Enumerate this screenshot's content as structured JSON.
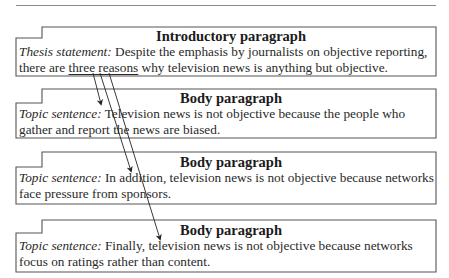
{
  "diagram": {
    "type": "essay-structure",
    "colors": {
      "border": "#555555",
      "text": "#222222",
      "arrow": "#222222",
      "rule": "#8a8a8a"
    },
    "boxes": [
      {
        "heading": "Introductory paragraph",
        "label": "Thesis statement:",
        "text_before": " Despite the emphasis by journalists on objective reporting, there are ",
        "underlined": "three reasons",
        "text_after": " why television news is anything but objective."
      },
      {
        "heading": "Body paragraph",
        "label": "Topic sentence:",
        "text": " Television news is not objective because the people who gather and report the news are biased."
      },
      {
        "heading": "Body paragraph",
        "label": "Topic sentence:",
        "text": " In addition, television news is not objective because networks face pressure from sponsors."
      },
      {
        "heading": "Body paragraph",
        "label": "Topic sentence:",
        "text": " Finally, television news is not objective because networks focus on ratings rather than content."
      }
    ],
    "arrows": [
      {
        "from": "three reasons",
        "to": "Body paragraph 1"
      },
      {
        "from": "three reasons",
        "to": "Body paragraph 2"
      },
      {
        "from": "three reasons",
        "to": "Body paragraph 3"
      }
    ]
  }
}
